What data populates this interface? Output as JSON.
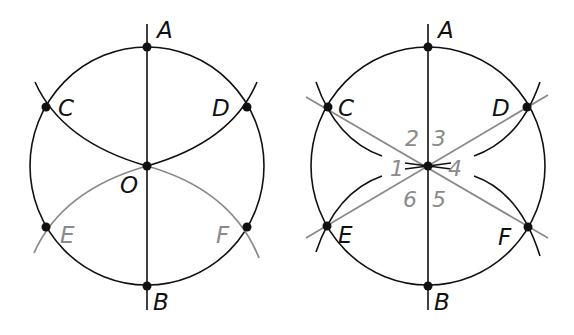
{
  "colors": {
    "ink": "#111111",
    "gray": "#8a8a8a"
  },
  "diagram_left": {
    "labels": {
      "A": "A",
      "B": "B",
      "C": "C",
      "D": "D",
      "O": "O",
      "E": "E",
      "F": "F"
    }
  },
  "diagram_right": {
    "labels": {
      "A": "A",
      "B": "B",
      "C": "C",
      "D": "D",
      "E": "E",
      "F": "F"
    },
    "angles": [
      "1",
      "2",
      "3",
      "4",
      "5",
      "6"
    ]
  }
}
